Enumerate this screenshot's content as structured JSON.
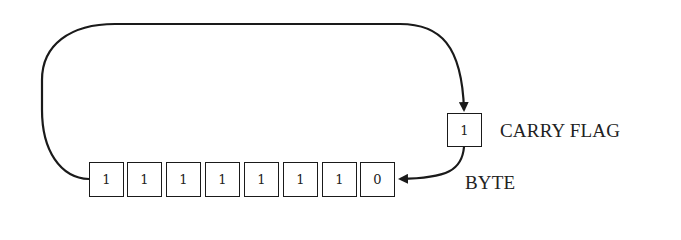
{
  "diagram": {
    "type": "rotate-left-through-carry",
    "byte": {
      "label": "BYTE",
      "bits": [
        "1",
        "1",
        "1",
        "1",
        "1",
        "1",
        "1",
        "0"
      ]
    },
    "carry_flag": {
      "label": "CARRY FLAG",
      "value": "1"
    },
    "colors": {
      "stroke": "#1a1a1a",
      "text": "#222222",
      "background": "#ffffff"
    }
  }
}
